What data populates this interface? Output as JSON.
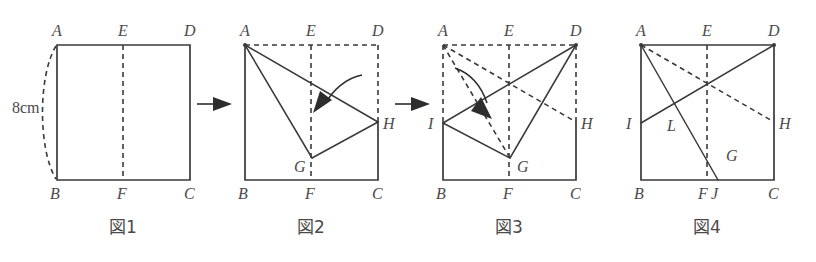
{
  "document": {
    "type": "geometry-figure-sequence",
    "description": "Paper folding sequence of a square, four stages",
    "background_color": "#ffffff",
    "ink_color": "#3a3a3a"
  },
  "dimension": {
    "side_label": "8cm"
  },
  "figures": [
    {
      "id": "fig1",
      "caption": "図1",
      "square": {
        "x": 57,
        "y": 45,
        "w": 133,
        "h": 135
      },
      "labels": [
        {
          "name": "A",
          "text": "A",
          "x": 57,
          "y": 31
        },
        {
          "name": "E",
          "text": "E",
          "x": 123,
          "y": 31
        },
        {
          "name": "D",
          "text": "D",
          "x": 190,
          "y": 31
        },
        {
          "name": "B",
          "text": "B",
          "x": 57,
          "y": 198
        },
        {
          "name": "F",
          "text": "F",
          "x": 123,
          "y": 198
        },
        {
          "name": "C",
          "text": "C",
          "x": 190,
          "y": 198
        }
      ]
    },
    {
      "id": "fig2",
      "caption": "図2",
      "square": {
        "x": 245,
        "y": 45,
        "w": 133,
        "h": 135
      },
      "labels": [
        {
          "name": "A",
          "text": "A",
          "x": 245,
          "y": 31
        },
        {
          "name": "E",
          "text": "E",
          "x": 311,
          "y": 31
        },
        {
          "name": "D",
          "text": "D",
          "x": 378,
          "y": 31
        },
        {
          "name": "B",
          "text": "B",
          "x": 245,
          "y": 198
        },
        {
          "name": "F",
          "text": "F",
          "x": 311,
          "y": 198
        },
        {
          "name": "C",
          "text": "C",
          "x": 378,
          "y": 198
        },
        {
          "name": "G",
          "text": "G",
          "x": 300,
          "y": 174
        },
        {
          "name": "H",
          "text": "H",
          "x": 392,
          "y": 128
        }
      ]
    },
    {
      "id": "fig3",
      "caption": "図3",
      "square": {
        "x": 443,
        "y": 45,
        "w": 133,
        "h": 135
      },
      "labels": [
        {
          "name": "A",
          "text": "A",
          "x": 443,
          "y": 31
        },
        {
          "name": "E",
          "text": "E",
          "x": 509,
          "y": 31
        },
        {
          "name": "D",
          "text": "D",
          "x": 576,
          "y": 31
        },
        {
          "name": "B",
          "text": "B",
          "x": 443,
          "y": 198
        },
        {
          "name": "F",
          "text": "F",
          "x": 509,
          "y": 198
        },
        {
          "name": "C",
          "text": "C",
          "x": 576,
          "y": 198
        },
        {
          "name": "G",
          "text": "G",
          "x": 522,
          "y": 174
        },
        {
          "name": "H",
          "text": "H",
          "x": 590,
          "y": 128
        },
        {
          "name": "I",
          "text": "I",
          "x": 432,
          "y": 128
        }
      ]
    },
    {
      "id": "fig4",
      "caption": "図4",
      "square": {
        "x": 641,
        "y": 45,
        "w": 133,
        "h": 135
      },
      "labels": [
        {
          "name": "A",
          "text": "A",
          "x": 641,
          "y": 31
        },
        {
          "name": "E",
          "text": "E",
          "x": 707,
          "y": 31
        },
        {
          "name": "D",
          "text": "D",
          "x": 774,
          "y": 31
        },
        {
          "name": "B",
          "text": "B",
          "x": 641,
          "y": 198
        },
        {
          "name": "F",
          "text": "F",
          "x": 704,
          "y": 198
        },
        {
          "name": "J",
          "text": "J",
          "x": 719,
          "y": 198
        },
        {
          "name": "C",
          "text": "C",
          "x": 774,
          "y": 198
        },
        {
          "name": "G",
          "text": "G",
          "x": 731,
          "y": 162
        },
        {
          "name": "H",
          "text": "H",
          "x": 788,
          "y": 128
        },
        {
          "name": "I",
          "text": "I",
          "x": 630,
          "y": 128
        },
        {
          "name": "L",
          "text": "L",
          "x": 672,
          "y": 130
        }
      ]
    }
  ],
  "transition_arrows": [
    {
      "name": "arrow-1-to-2",
      "x": 196,
      "y": 104
    },
    {
      "name": "arrow-2-to-3",
      "x": 394,
      "y": 104
    },
    {
      "name": "arrow-3-to-4",
      "x": 592,
      "y": 104
    }
  ],
  "captions": [
    {
      "name": "caption-fig1",
      "text": "図1",
      "x": 123,
      "y": 232
    },
    {
      "name": "caption-fig2",
      "text": "図2",
      "x": 311,
      "y": 232
    },
    {
      "name": "caption-fig3",
      "text": "図3",
      "x": 509,
      "y": 232
    },
    {
      "name": "caption-fig4",
      "text": "図4",
      "x": 707,
      "y": 232
    }
  ]
}
